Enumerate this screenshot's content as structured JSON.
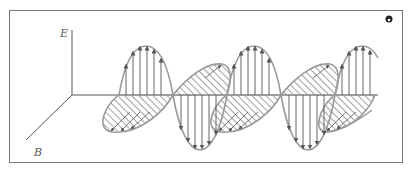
{
  "diagram": {
    "axes": {
      "e_label": "E",
      "b_label": "B"
    },
    "colors": {
      "frame": "#777777",
      "wave_outline": "#9a9a9a",
      "arrow": "#555555",
      "hatch": "#4a4a4a",
      "axis": "#555555",
      "background": "#ffffff"
    },
    "corner_icon": "audio-icon",
    "e_field": {
      "peaks_x": [
        146,
        254,
        362
      ],
      "troughs_x": [
        200,
        308
      ],
      "axis_y": 95,
      "amplitude_px": 50
    },
    "b_field": {
      "lobes_below_x": [
        120,
        228,
        336
      ],
      "lobes_above_x": [
        200,
        308
      ]
    }
  }
}
